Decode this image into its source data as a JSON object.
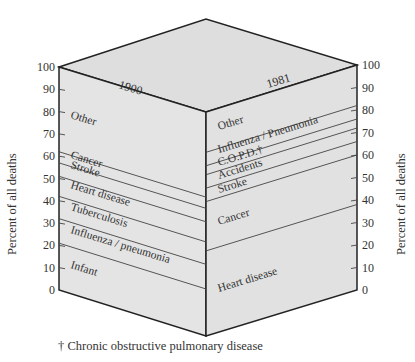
{
  "chart_data": {
    "type": "bar",
    "subtype": "3d-stacked-percent-block",
    "title": "",
    "ylabel": "Percent of all deaths",
    "ylim": [
      0,
      100
    ],
    "yticks": [
      0,
      10,
      20,
      30,
      40,
      50,
      60,
      70,
      80,
      90,
      100
    ],
    "categories": [
      "1900",
      "1981"
    ],
    "series": {
      "1900": [
        {
          "name": "Infant",
          "from": 0,
          "to": 21
        },
        {
          "name": "Influenza/pneumonia",
          "from": 21,
          "to": 32
        },
        {
          "name": "Tuberculosis",
          "from": 32,
          "to": 42
        },
        {
          "name": "Heart disease",
          "from": 42,
          "to": 51
        },
        {
          "name": "Stroke",
          "from": 51,
          "to": 57
        },
        {
          "name": "Cancer",
          "from": 57,
          "to": 62
        },
        {
          "name": "Other",
          "from": 62,
          "to": 100
        }
      ],
      "1981": [
        {
          "name": "Heart disease",
          "from": 0,
          "to": 38
        },
        {
          "name": "Cancer",
          "from": 38,
          "to": 60
        },
        {
          "name": "Stroke",
          "from": 60,
          "to": 66
        },
        {
          "name": "Accidents",
          "from": 66,
          "to": 72
        },
        {
          "name": "C.O.P.D.†",
          "from": 72,
          "to": 76
        },
        {
          "name": "Influenza/Pneumonia",
          "from": 76,
          "to": 82
        },
        {
          "name": "Other",
          "from": 82,
          "to": 100
        }
      ]
    },
    "annotations": [
      "† Chronic obstructive pulmonary disease"
    ],
    "grid": false,
    "legend": "none (labels drawn inside bands)"
  },
  "labels": {
    "left_year": "1900",
    "right_year": "1981",
    "left_axis_title": "Percent of all deaths",
    "right_axis_title": "Percent of all deaths",
    "ticks": [
      "0",
      "10",
      "20",
      "30",
      "40",
      "50",
      "60",
      "70",
      "80",
      "90",
      "100"
    ],
    "left_bands": [
      "Other",
      "Cancer",
      "Stroke",
      "Heart disease",
      "Tuberculosis",
      "Influenza / pneumonia",
      "Infant"
    ],
    "right_bands": [
      "Other",
      "Influenza / Pneumonia",
      "C.O.P.D.†",
      "Accidents",
      "Stroke",
      "Cancer",
      "Heart disease"
    ],
    "footnote": "† Chronic obstructive pulmonary disease"
  },
  "colors": {
    "face": "#e6e6e6",
    "top": "#dcdcdc",
    "edge": "#222222",
    "band_line": "#444444"
  }
}
